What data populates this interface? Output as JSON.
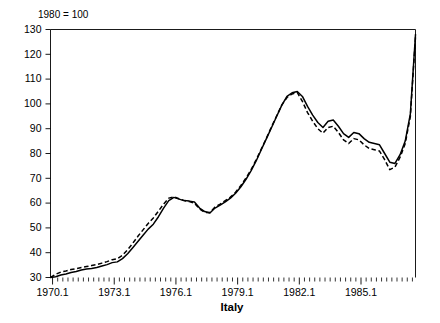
{
  "chart_data": {
    "type": "line",
    "title": "Italy",
    "note": "1980 = 100",
    "xlabel": "",
    "ylabel": "",
    "ylim": [
      30,
      130
    ],
    "yticks": [
      30,
      40,
      50,
      60,
      70,
      80,
      90,
      100,
      110,
      120,
      130
    ],
    "xlim": [
      1970.0,
      1987.75
    ],
    "xticks": [
      1970.1,
      1973.1,
      1976.1,
      1979.1,
      1982.1,
      1985.1
    ],
    "xtick_labels": [
      "1970.1",
      "1973.1",
      "1976.1",
      "1979.1",
      "1982.1",
      "1985.1"
    ],
    "minor_tick_step": 0.25,
    "grid": false,
    "legend": null,
    "x": [
      1970.0,
      1970.25,
      1970.5,
      1970.75,
      1971.0,
      1971.25,
      1971.5,
      1971.75,
      1972.0,
      1972.25,
      1972.5,
      1972.75,
      1973.0,
      1973.25,
      1973.5,
      1973.75,
      1974.0,
      1974.25,
      1974.5,
      1974.75,
      1975.0,
      1975.25,
      1975.5,
      1975.75,
      1976.0,
      1976.25,
      1976.5,
      1976.75,
      1977.0,
      1977.25,
      1977.5,
      1977.75,
      1978.0,
      1978.25,
      1978.5,
      1978.75,
      1979.0,
      1979.25,
      1979.5,
      1979.75,
      1980.0,
      1980.25,
      1980.5,
      1980.75,
      1981.0,
      1981.25,
      1981.5,
      1981.75,
      1982.0,
      1982.25,
      1982.5,
      1982.75,
      1983.0,
      1983.25,
      1983.5,
      1983.75,
      1984.0,
      1984.25,
      1984.5,
      1984.75,
      1985.0,
      1985.25,
      1985.5,
      1985.75,
      1986.0,
      1986.25,
      1986.5,
      1986.75,
      1987.0,
      1987.25,
      1987.5,
      1987.75
    ],
    "series": [
      {
        "name": "solid-series",
        "style": "solid",
        "values": [
          30.0,
          30.3,
          31.0,
          31.4,
          32.0,
          32.4,
          33.0,
          33.4,
          33.6,
          34.0,
          34.6,
          35.2,
          36.0,
          36.3,
          37.6,
          39.6,
          42.0,
          44.5,
          47.0,
          49.5,
          51.5,
          54.5,
          58.0,
          61.0,
          62.3,
          61.6,
          61.0,
          60.8,
          60.4,
          58.0,
          56.6,
          56.0,
          58.0,
          59.2,
          60.5,
          62.0,
          64.0,
          66.5,
          69.5,
          73.0,
          77.0,
          81.5,
          86.0,
          90.5,
          95.0,
          99.5,
          103.0,
          104.5,
          105.0,
          103.0,
          99.0,
          95.5,
          92.5,
          90.5,
          93.0,
          93.5,
          91.0,
          88.0,
          86.5,
          88.5,
          88.0,
          86.0,
          84.5,
          84.0,
          83.5,
          80.0,
          76.5,
          76.0,
          79.5,
          85.0,
          96.0,
          128.0
        ]
      },
      {
        "name": "dashed-series",
        "style": "dashed",
        "values": [
          30.0,
          31.3,
          32.2,
          32.6,
          33.2,
          33.6,
          34.0,
          34.4,
          34.8,
          35.2,
          35.8,
          36.4,
          37.2,
          37.6,
          39.0,
          41.2,
          43.8,
          46.6,
          49.2,
          51.8,
          54.0,
          56.8,
          59.6,
          62.0,
          62.5,
          61.8,
          61.0,
          60.6,
          60.0,
          57.6,
          56.2,
          56.2,
          58.4,
          59.6,
          61.0,
          62.4,
          64.4,
          67.0,
          70.0,
          73.4,
          77.4,
          81.8,
          86.2,
          90.8,
          95.2,
          99.6,
          102.6,
          104.0,
          104.6,
          101.0,
          96.5,
          93.0,
          90.0,
          88.2,
          90.5,
          91.0,
          88.5,
          85.5,
          84.0,
          86.0,
          85.5,
          83.5,
          82.0,
          81.5,
          81.0,
          77.5,
          73.5,
          74.5,
          78.5,
          84.0,
          95.0,
          127.0
        ]
      }
    ]
  }
}
